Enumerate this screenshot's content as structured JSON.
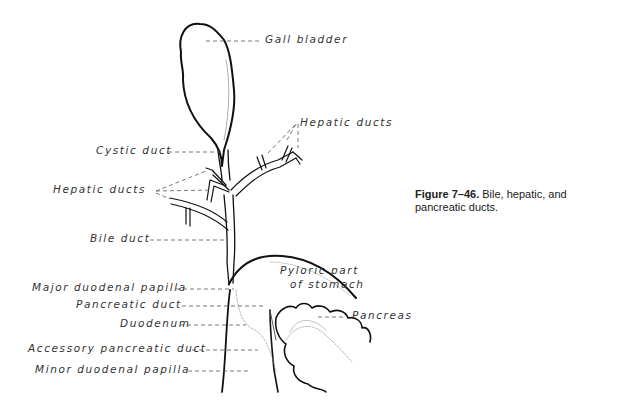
{
  "figure": {
    "caption_label": "Figure 7–46.",
    "caption_text": " Bile, hepatic, and pancreatic ducts."
  },
  "labels": {
    "gall_bladder": "Gall bladder",
    "hepatic_ducts_upper": "Hepatic ducts",
    "cystic_duct": "Cystic duct",
    "hepatic_ducts_left": "Hepatic ducts",
    "bile_duct": "Bile duct",
    "pyloric_1": "Pyloric part",
    "pyloric_2": "of stomach",
    "major_papilla": "Major duodenal papilla",
    "pancreatic_duct": "Pancreatic duct",
    "pancreas": "Pancreas",
    "duodenum": "Duodenum",
    "accessory_duct": "Accessory pancreatic duct",
    "minor_papilla": "Minor duodenal papilla"
  }
}
